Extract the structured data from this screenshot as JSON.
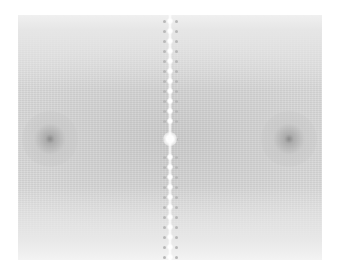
{
  "image": {
    "description": "Grayscale 2D Fourier magnitude spectrum",
    "background": "#ffffff",
    "field_color": "#dcdcdc",
    "field": {
      "x": 18,
      "y": 15,
      "w": 304,
      "h": 245
    },
    "center": {
      "x": 152,
      "y": 124
    },
    "dark_spots": [
      {
        "name": "left-dark-spot",
        "x": 32,
        "y": 124,
        "r": 28,
        "core": "#8a8a8a"
      },
      {
        "name": "right-dark-spot",
        "x": 271,
        "y": 124,
        "r": 28,
        "core": "#8a8a8a"
      }
    ],
    "center_line_x": 152,
    "dot_rows": [
      6,
      16,
      26,
      36,
      46,
      56,
      66,
      76,
      86,
      96,
      106,
      124,
      142,
      152,
      162,
      172,
      182,
      192,
      202,
      212,
      222,
      232,
      242
    ],
    "dot_offsets": [
      -6,
      6
    ]
  }
}
